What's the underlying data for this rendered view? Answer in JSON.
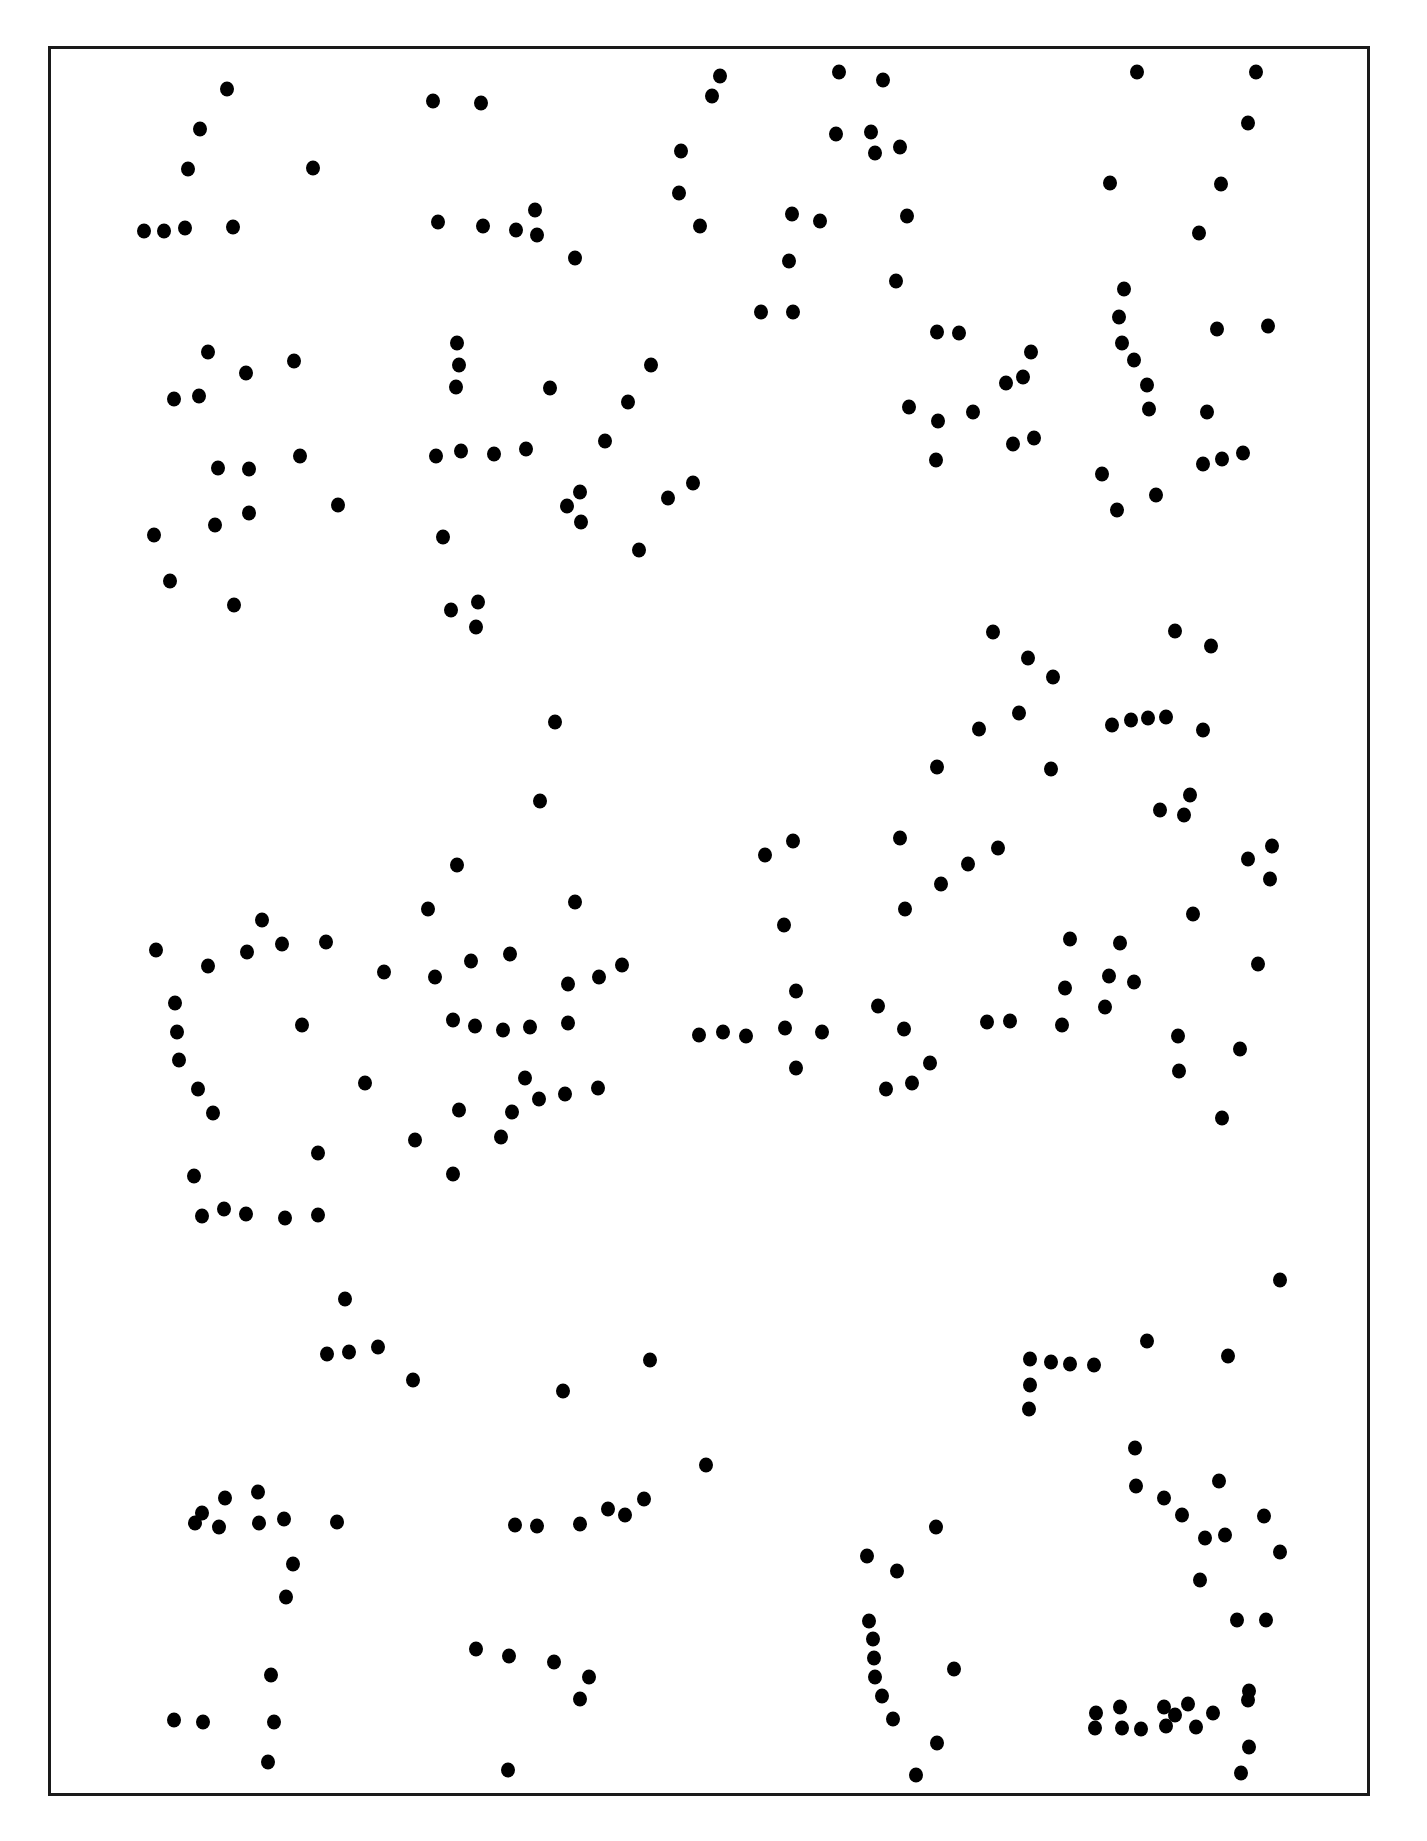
{
  "page": {
    "background_color": "#ffffff",
    "frame": {
      "border_color": "#1a1a1a",
      "left": 48,
      "top": 46,
      "right": 1370,
      "bottom": 1796
    },
    "dot_color": "#000000",
    "dot_radius": 7
  },
  "dots": [
    [
      227,
      89
    ],
    [
      200,
      129
    ],
    [
      188,
      169
    ],
    [
      313,
      168
    ],
    [
      144,
      231
    ],
    [
      164,
      231
    ],
    [
      185,
      228
    ],
    [
      233,
      227
    ],
    [
      433,
      101
    ],
    [
      481,
      103
    ],
    [
      438,
      222
    ],
    [
      483,
      226
    ],
    [
      516,
      230
    ],
    [
      535,
      210
    ],
    [
      537,
      235
    ],
    [
      575,
      258
    ],
    [
      720,
      76
    ],
    [
      712,
      96
    ],
    [
      681,
      151
    ],
    [
      679,
      193
    ],
    [
      700,
      226
    ],
    [
      839,
      72
    ],
    [
      883,
      80
    ],
    [
      836,
      134
    ],
    [
      871,
      132
    ],
    [
      875,
      153
    ],
    [
      900,
      147
    ],
    [
      907,
      216
    ],
    [
      792,
      214
    ],
    [
      820,
      221
    ],
    [
      789,
      261
    ],
    [
      896,
      281
    ],
    [
      761,
      312
    ],
    [
      793,
      312
    ],
    [
      1137,
      72
    ],
    [
      1256,
      72
    ],
    [
      1248,
      123
    ],
    [
      1110,
      183
    ],
    [
      1221,
      184
    ],
    [
      1199,
      233
    ],
    [
      208,
      352
    ],
    [
      246,
      373
    ],
    [
      294,
      361
    ],
    [
      174,
      399
    ],
    [
      199,
      396
    ],
    [
      218,
      468
    ],
    [
      249,
      469
    ],
    [
      300,
      456
    ],
    [
      338,
      505
    ],
    [
      249,
      513
    ],
    [
      215,
      525
    ],
    [
      154,
      535
    ],
    [
      170,
      581
    ],
    [
      234,
      605
    ],
    [
      457,
      343
    ],
    [
      459,
      365
    ],
    [
      456,
      387
    ],
    [
      550,
      388
    ],
    [
      651,
      365
    ],
    [
      628,
      402
    ],
    [
      605,
      441
    ],
    [
      436,
      456
    ],
    [
      461,
      451
    ],
    [
      494,
      454
    ],
    [
      526,
      449
    ],
    [
      580,
      492
    ],
    [
      567,
      506
    ],
    [
      581,
      522
    ],
    [
      668,
      498
    ],
    [
      693,
      483
    ],
    [
      443,
      537
    ],
    [
      639,
      550
    ],
    [
      451,
      610
    ],
    [
      478,
      602
    ],
    [
      476,
      627
    ],
    [
      937,
      332
    ],
    [
      959,
      333
    ],
    [
      1031,
      352
    ],
    [
      1023,
      377
    ],
    [
      1006,
      383
    ],
    [
      909,
      407
    ],
    [
      938,
      421
    ],
    [
      973,
      412
    ],
    [
      1013,
      444
    ],
    [
      1034,
      438
    ],
    [
      936,
      460
    ],
    [
      1124,
      289
    ],
    [
      1119,
      317
    ],
    [
      1122,
      343
    ],
    [
      1134,
      360
    ],
    [
      1147,
      385
    ],
    [
      1149,
      409
    ],
    [
      1217,
      329
    ],
    [
      1268,
      326
    ],
    [
      1207,
      412
    ],
    [
      1203,
      464
    ],
    [
      1222,
      459
    ],
    [
      1243,
      453
    ],
    [
      1102,
      474
    ],
    [
      1156,
      495
    ],
    [
      1117,
      510
    ],
    [
      555,
      722
    ],
    [
      540,
      801
    ],
    [
      993,
      632
    ],
    [
      1028,
      658
    ],
    [
      1053,
      677
    ],
    [
      1019,
      713
    ],
    [
      979,
      729
    ],
    [
      937,
      767
    ],
    [
      1051,
      769
    ],
    [
      1175,
      631
    ],
    [
      1211,
      646
    ],
    [
      1112,
      725
    ],
    [
      1131,
      720
    ],
    [
      1148,
      718
    ],
    [
      1166,
      717
    ],
    [
      1203,
      730
    ],
    [
      1190,
      795
    ],
    [
      1160,
      810
    ],
    [
      1184,
      815
    ],
    [
      1272,
      846
    ],
    [
      1248,
      859
    ],
    [
      1270,
      879
    ],
    [
      457,
      865
    ],
    [
      428,
      909
    ],
    [
      575,
      902
    ],
    [
      262,
      920
    ],
    [
      156,
      950
    ],
    [
      208,
      966
    ],
    [
      247,
      952
    ],
    [
      282,
      944
    ],
    [
      326,
      942
    ],
    [
      384,
      972
    ],
    [
      435,
      977
    ],
    [
      471,
      961
    ],
    [
      510,
      954
    ],
    [
      622,
      965
    ],
    [
      599,
      977
    ],
    [
      568,
      984
    ],
    [
      175,
      1003
    ],
    [
      302,
      1025
    ],
    [
      453,
      1020
    ],
    [
      475,
      1026
    ],
    [
      503,
      1030
    ],
    [
      530,
      1027
    ],
    [
      568,
      1023
    ],
    [
      177,
      1032
    ],
    [
      179,
      1060
    ],
    [
      365,
      1083
    ],
    [
      525,
      1078
    ],
    [
      198,
      1089
    ],
    [
      539,
      1099
    ],
    [
      565,
      1094
    ],
    [
      598,
      1088
    ],
    [
      213,
      1113
    ],
    [
      459,
      1110
    ],
    [
      512,
      1112
    ],
    [
      415,
      1140
    ],
    [
      501,
      1137
    ],
    [
      318,
      1153
    ],
    [
      194,
      1176
    ],
    [
      453,
      1174
    ],
    [
      202,
      1216
    ],
    [
      224,
      1209
    ],
    [
      246,
      1214
    ],
    [
      285,
      1218
    ],
    [
      318,
      1215
    ],
    [
      793,
      841
    ],
    [
      765,
      855
    ],
    [
      900,
      838
    ],
    [
      998,
      848
    ],
    [
      968,
      864
    ],
    [
      941,
      884
    ],
    [
      905,
      909
    ],
    [
      784,
      925
    ],
    [
      796,
      991
    ],
    [
      878,
      1006
    ],
    [
      699,
      1035
    ],
    [
      723,
      1032
    ],
    [
      746,
      1036
    ],
    [
      785,
      1028
    ],
    [
      822,
      1032
    ],
    [
      904,
      1029
    ],
    [
      796,
      1068
    ],
    [
      930,
      1063
    ],
    [
      912,
      1083
    ],
    [
      886,
      1089
    ],
    [
      987,
      1022
    ],
    [
      1010,
      1021
    ],
    [
      1070,
      939
    ],
    [
      1120,
      943
    ],
    [
      1109,
      976
    ],
    [
      1134,
      982
    ],
    [
      1065,
      988
    ],
    [
      1105,
      1007
    ],
    [
      1062,
      1025
    ],
    [
      1193,
      914
    ],
    [
      1178,
      1036
    ],
    [
      1258,
      964
    ],
    [
      1240,
      1049
    ],
    [
      1179,
      1071
    ],
    [
      1222,
      1118
    ],
    [
      345,
      1299
    ],
    [
      327,
      1354
    ],
    [
      349,
      1352
    ],
    [
      378,
      1347
    ],
    [
      413,
      1380
    ],
    [
      563,
      1391
    ],
    [
      650,
      1360
    ],
    [
      1280,
      1280
    ],
    [
      202,
      1513
    ],
    [
      225,
      1498
    ],
    [
      258,
      1492
    ],
    [
      219,
      1527
    ],
    [
      195,
      1523
    ],
    [
      259,
      1523
    ],
    [
      284,
      1519
    ],
    [
      337,
      1522
    ],
    [
      293,
      1564
    ],
    [
      286,
      1597
    ],
    [
      515,
      1525
    ],
    [
      537,
      1526
    ],
    [
      580,
      1524
    ],
    [
      608,
      1509
    ],
    [
      625,
      1515
    ],
    [
      644,
      1499
    ],
    [
      706,
      1465
    ],
    [
      1030,
      1359
    ],
    [
      1051,
      1362
    ],
    [
      1070,
      1364
    ],
    [
      1094,
      1365
    ],
    [
      1147,
      1341
    ],
    [
      1228,
      1356
    ],
    [
      1030,
      1385
    ],
    [
      1029,
      1409
    ],
    [
      1135,
      1448
    ],
    [
      1136,
      1486
    ],
    [
      1164,
      1498
    ],
    [
      1182,
      1515
    ],
    [
      1205,
      1538
    ],
    [
      1225,
      1535
    ],
    [
      1219,
      1481
    ],
    [
      1264,
      1516
    ],
    [
      1280,
      1552
    ],
    [
      1200,
      1580
    ],
    [
      1237,
      1620
    ],
    [
      1266,
      1620
    ],
    [
      867,
      1556
    ],
    [
      897,
      1571
    ],
    [
      936,
      1527
    ],
    [
      869,
      1621
    ],
    [
      873,
      1639
    ],
    [
      874,
      1658
    ],
    [
      875,
      1677
    ],
    [
      882,
      1696
    ],
    [
      893,
      1719
    ],
    [
      954,
      1669
    ],
    [
      937,
      1743
    ],
    [
      916,
      1775
    ],
    [
      174,
      1720
    ],
    [
      203,
      1722
    ],
    [
      271,
      1675
    ],
    [
      274,
      1722
    ],
    [
      268,
      1762
    ],
    [
      476,
      1649
    ],
    [
      509,
      1656
    ],
    [
      554,
      1662
    ],
    [
      589,
      1677
    ],
    [
      580,
      1699
    ],
    [
      508,
      1770
    ],
    [
      1096,
      1713
    ],
    [
      1120,
      1707
    ],
    [
      1141,
      1729
    ],
    [
      1164,
      1707
    ],
    [
      1166,
      1726
    ],
    [
      1175,
      1715
    ],
    [
      1188,
      1704
    ],
    [
      1196,
      1727
    ],
    [
      1213,
      1713
    ],
    [
      1248,
      1700
    ],
    [
      1249,
      1747
    ],
    [
      1241,
      1773
    ],
    [
      1249,
      1691
    ],
    [
      1095,
      1728
    ],
    [
      1122,
      1728
    ]
  ]
}
